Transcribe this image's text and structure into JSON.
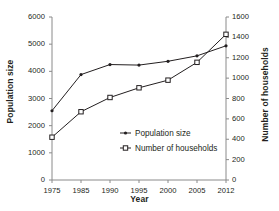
{
  "chart_data": {
    "type": "line",
    "title": "",
    "xlabel": "Year",
    "ylabel": "Population size",
    "y2label": "Number of households",
    "categories": [
      "1975",
      "1985",
      "1990",
      "1995",
      "2000",
      "2005",
      "2012"
    ],
    "ylim": [
      0,
      6000
    ],
    "y2lim": [
      0,
      1600
    ],
    "yticks": [
      "0",
      "1000",
      "2000",
      "3000",
      "4000",
      "5000",
      "6000"
    ],
    "y2ticks": [
      "0",
      "200",
      "400",
      "600",
      "800",
      "1000",
      "1200",
      "1400",
      "1600"
    ],
    "grid": false,
    "legend_position": "inside-bottom-center",
    "series": [
      {
        "name": "Population size",
        "axis": "left",
        "marker": "dot",
        "color": "#231f20",
        "values": [
          2550,
          3880,
          4250,
          4230,
          4370,
          4570,
          4940
        ]
      },
      {
        "name": "Number of households",
        "axis": "right",
        "marker": "square",
        "color": "#231f20",
        "values": [
          420,
          670,
          810,
          905,
          980,
          1155,
          1430
        ]
      }
    ]
  },
  "axes": {
    "x_title": "Year",
    "y_left_title": "Population size",
    "y_right_title": "Number of households"
  },
  "legend": {
    "items": [
      {
        "label": "Population size",
        "marker": "dot-line-marker"
      },
      {
        "label": "Number of households",
        "marker": "square-line-marker"
      }
    ]
  }
}
